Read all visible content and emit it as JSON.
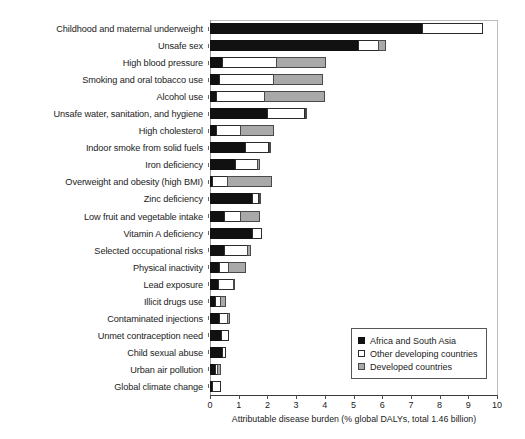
{
  "chart_data": {
    "type": "bar",
    "orientation": "horizontal",
    "stacked": true,
    "title": "",
    "xlabel": "Attributable disease burden (% global DALYs, total 1.46 billion)",
    "ylabel": "",
    "xlim": [
      0,
      10
    ],
    "xticks": [
      0,
      1,
      2,
      3,
      4,
      5,
      6,
      7,
      8,
      9,
      10
    ],
    "grid": false,
    "legend_position": "bottom-right",
    "categories": [
      "Childhood and maternal underweight",
      "Unsafe sex",
      "High blood pressure",
      "Smoking and oral tobacco use",
      "Alcohol use",
      "Unsafe water, sanitation, and hygiene",
      "High cholesterol",
      "Indoor smoke from solid fuels",
      "Iron deficiency",
      "Overweight and obesity (high BMI)",
      "Zinc deficiency",
      "Low fruit and vegetable intake",
      "Vitamin A deficiency",
      "Selected occupational risks",
      "Physical inactivity",
      "Lead exposure",
      "Illicit drugs use",
      "Contaminated injections",
      "Unmet contraception need",
      "Child sexual abuse",
      "Urban air pollution",
      "Global climate change"
    ],
    "series": [
      {
        "name": "Africa and South Asia",
        "color": "#111111",
        "values": [
          7.4,
          5.2,
          0.45,
          0.35,
          0.25,
          2.0,
          0.25,
          1.25,
          0.9,
          0.1,
          1.5,
          0.5,
          1.5,
          0.5,
          0.35,
          0.3,
          0.2,
          0.35,
          0.4,
          0.45,
          0.2,
          0.1
        ]
      },
      {
        "name": "Other developing countries",
        "color": "#ffffff",
        "values": [
          2.15,
          0.7,
          1.9,
          1.9,
          1.7,
          1.35,
          0.85,
          0.85,
          0.8,
          0.55,
          0.25,
          0.6,
          0.35,
          0.85,
          0.35,
          0.55,
          0.2,
          0.3,
          0.3,
          0.15,
          0.1,
          0.3
        ]
      },
      {
        "name": "Developed countries",
        "color": "#a9a9a9",
        "values": [
          0.0,
          0.3,
          1.75,
          1.75,
          2.1,
          0.05,
          1.2,
          0.05,
          0.1,
          1.55,
          0.05,
          0.7,
          0.0,
          0.15,
          0.6,
          0.05,
          0.2,
          0.1,
          0.0,
          0.0,
          0.15,
          0.0
        ]
      }
    ],
    "totals": [
      9.55,
      6.2,
      4.1,
      4.0,
      4.05,
      3.4,
      2.3,
      2.15,
      1.8,
      2.2,
      1.8,
      1.8,
      1.85,
      1.5,
      1.3,
      0.9,
      0.6,
      0.75,
      0.7,
      0.6,
      0.45,
      0.4
    ]
  },
  "legend": {
    "items": [
      {
        "label": "Africa and South Asia",
        "swatch": "filled-black-square-icon"
      },
      {
        "label": "Other developing countries",
        "swatch": "hollow-white-square-icon"
      },
      {
        "label": "Developed countries",
        "swatch": "filled-gray-square-icon"
      }
    ]
  }
}
